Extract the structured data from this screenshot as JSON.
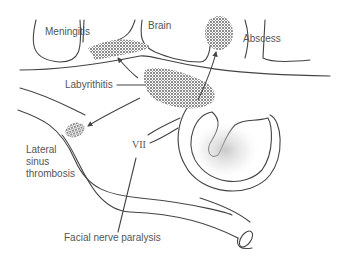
{
  "diagram": {
    "labels": {
      "meningitis": "Meningitis",
      "brain": "Brain",
      "abscess": "Abscess",
      "labyrinthitis": "Labyrithitis",
      "lateral_sinus": "Lateral\nsinus\nthrombosis",
      "nerve": "VII",
      "facial_paralysis": "Facial nerve paralysis"
    },
    "colors": {
      "line": "#444444",
      "stipple": "#555555",
      "text": "#555555",
      "background": "#ffffff"
    }
  }
}
